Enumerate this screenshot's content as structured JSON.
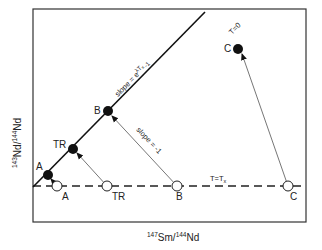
{
  "axes": {
    "x_label_sup1": "147",
    "x_label_base1": "Sm/",
    "x_label_sup2": "144",
    "x_label_base2": "Nd",
    "y_label_sup1": "143",
    "y_label_base1": "Nd/",
    "y_label_sup2": "144",
    "y_label_base2": "Nd"
  },
  "isochron_present": {
    "label": "T=0",
    "slope_label": "slope = e",
    "slope_exp": "λT",
    "slope_sub": "x",
    "slope_tail": "-1"
  },
  "isochron_past": {
    "label": "T=T",
    "label_sub": "x"
  },
  "evolution_arrow": {
    "slope_label": "slope = -1"
  },
  "present_points": [
    {
      "label": "A"
    },
    {
      "label": "TR"
    },
    {
      "label": "B"
    },
    {
      "label": "C"
    }
  ],
  "past_points": [
    {
      "label": "A"
    },
    {
      "label": "TR"
    },
    {
      "label": "B"
    },
    {
      "label": "C"
    }
  ],
  "colors": {
    "line": "#1a1a1a",
    "arrow": "#666666",
    "frame": "#333333"
  }
}
